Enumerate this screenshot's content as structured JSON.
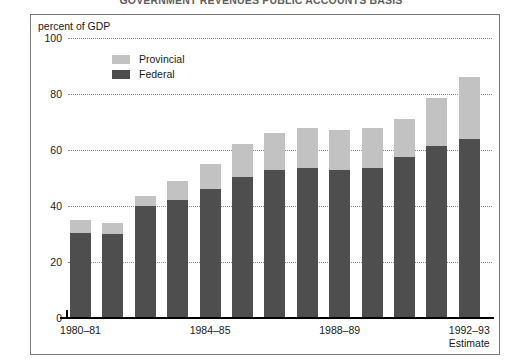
{
  "header": {
    "title": "GOVERNMENT REVENUES    PUBLIC ACCOUNTS BASIS"
  },
  "axis_title": "percent of GDP",
  "legend": {
    "items": [
      {
        "label": "Provincial",
        "color": "#c2c2c2",
        "key": "provincial"
      },
      {
        "label": "Federal",
        "color": "#4e4e4e",
        "key": "federal"
      }
    ]
  },
  "y_axis": {
    "ticks": [
      "0",
      "20",
      "40",
      "60",
      "80",
      "100"
    ],
    "min": 0,
    "max": 100
  },
  "x_axis": {
    "labels": [
      {
        "text": "1980–81",
        "index": 0,
        "sub": ""
      },
      {
        "text": "1984–85",
        "index": 4,
        "sub": ""
      },
      {
        "text": "1988–89",
        "index": 8,
        "sub": ""
      },
      {
        "text": "1992–93",
        "index": 12,
        "sub": "Estimate"
      }
    ]
  },
  "chart_data": {
    "type": "bar",
    "title": "GOVERNMENT REVENUES    PUBLIC ACCOUNTS BASIS",
    "subtitle": "",
    "xlabel": "",
    "ylabel": "percent of GDP",
    "ylim": [
      0,
      100
    ],
    "stacked": true,
    "grid": true,
    "legend_position": "top-left",
    "categories": [
      "1980–81",
      "1981–82",
      "1982–83",
      "1983–84",
      "1984–85",
      "1985–86",
      "1986–87",
      "1987–88",
      "1988–89",
      "1989–90",
      "1990–91",
      "1991–92",
      "1992–93"
    ],
    "series": [
      {
        "name": "Federal",
        "color": "#4e4e4e",
        "values": [
          30.5,
          30.0,
          40.0,
          42.0,
          46.0,
          50.5,
          53.0,
          53.5,
          53.0,
          53.5,
          57.5,
          61.5,
          64.0
        ]
      },
      {
        "name": "Provincial",
        "color": "#c2c2c2",
        "values": [
          4.5,
          4.0,
          3.5,
          7.0,
          9.0,
          11.5,
          13.0,
          14.5,
          14.0,
          14.5,
          13.5,
          17.0,
          22.0
        ]
      }
    ],
    "totals": [
      35.0,
      34.0,
      43.5,
      49.0,
      55.0,
      62.0,
      66.0,
      68.0,
      67.0,
      68.0,
      71.0,
      78.5,
      86.0
    ],
    "annotations": [
      "Estimate"
    ]
  }
}
